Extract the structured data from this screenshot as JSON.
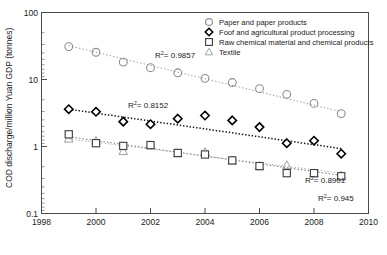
{
  "chart_data": {
    "type": "scatter",
    "title": "",
    "xlabel": "",
    "ylabel": "COD discharge/million Yuan GDP (tonnes)",
    "xlim": [
      1998,
      2010
    ],
    "ylim": [
      0.1,
      100
    ],
    "yscale": "log",
    "grid": false,
    "legend_position": "top-right",
    "xticks": [
      "1998",
      "2000",
      "2002",
      "2004",
      "2006",
      "2008",
      "2010"
    ],
    "yticks": [
      "0.1",
      "1",
      "10",
      "100"
    ],
    "x": [
      1999,
      2000,
      2001,
      2002,
      2003,
      2004,
      2005,
      2006,
      2007,
      2008,
      2009
    ],
    "series": [
      {
        "name": "Paper and paper products",
        "marker": "circle",
        "color": "#8d8d8d",
        "values": [
          31.0,
          25.5,
          18.2,
          15.0,
          12.6,
          10.4,
          9.0,
          7.3,
          6.0,
          4.4,
          3.1
        ],
        "r2_label": "R",
        "r2_exponent": "2",
        "r2_value": "= 0.9857",
        "trend_start": [
          1999,
          32.0
        ],
        "trend_end": [
          2009,
          3.3
        ]
      },
      {
        "name": "Foof and agricultural product processing",
        "marker": "diamond",
        "color": "#000000",
        "values": [
          3.6,
          3.3,
          2.35,
          2.15,
          2.6,
          2.9,
          2.45,
          1.95,
          1.12,
          1.22,
          0.78
        ],
        "r2_label": "R",
        "r2_exponent": "2",
        "r2_value": "= 0.8152",
        "trend_start": [
          1999,
          3.6
        ],
        "trend_end": [
          2009,
          0.93
        ]
      },
      {
        "name": "Raw chemical material and chemical products",
        "marker": "square",
        "color": "#3c3c3c",
        "values": [
          1.52,
          1.12,
          1.02,
          1.05,
          0.8,
          0.76,
          0.62,
          0.51,
          0.4,
          0.4,
          0.36
        ],
        "r2_label": "R",
        "r2_exponent": "2",
        "r2_value": "= 0.945",
        "trend_start": [
          1999,
          1.4
        ],
        "trend_end": [
          2009,
          0.37
        ]
      },
      {
        "name": "Textile",
        "marker": "triangle",
        "color": "#a0a0a0",
        "values": [
          1.32,
          1.22,
          0.86,
          1.05,
          0.8,
          0.83,
          0.62,
          0.51,
          0.53,
          0.4,
          0.37
        ],
        "r2_label": "R",
        "r2_exponent": "2",
        "r2_value": "= 0.8901",
        "trend_start": [
          1999,
          1.3
        ],
        "trend_end": [
          2009,
          0.4
        ]
      }
    ],
    "annotations": [
      {
        "text_label": "R",
        "text_exp": "2",
        "text_value": "= 0.9857",
        "x": 155,
        "y": 58
      },
      {
        "text_label": "R",
        "text_exp": "2",
        "text_value": "= 0.8152",
        "x": 128,
        "y": 108
      },
      {
        "text_label": "R",
        "text_exp": "2",
        "text_value": "= 0.8901",
        "x": 307,
        "y": 183
      },
      {
        "text_label": "R",
        "text_exp": "2",
        "text_value": "= 0.945",
        "x": 320,
        "y": 201
      }
    ]
  },
  "legend": {
    "items": [
      {
        "label": "Paper and paper products",
        "marker": "circle"
      },
      {
        "label": "Foof and agricultural product processing",
        "marker": "diamond"
      },
      {
        "label": "Raw chemical material and chemical products",
        "marker": "square"
      },
      {
        "label": "Textile",
        "marker": "triangle"
      }
    ]
  },
  "axes": {
    "y_title": "COD discharge/million Yuan GDP (tonnes)",
    "y_tick_100": "100",
    "y_tick_10": "10",
    "y_tick_1": "1",
    "y_tick_01": "0.1",
    "x_tick_1998": "1998",
    "x_tick_2000": "2000",
    "x_tick_2002": "2002",
    "x_tick_2004": "2004",
    "x_tick_2006": "2006",
    "x_tick_2008": "2008",
    "x_tick_2010": "2010"
  }
}
